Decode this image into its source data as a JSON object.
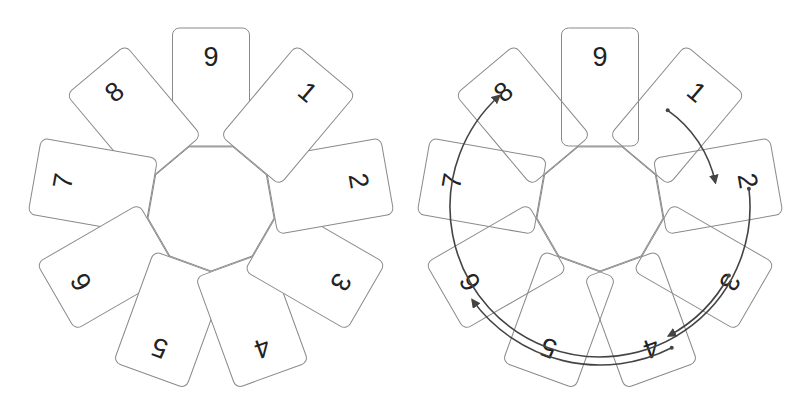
{
  "diagram": {
    "card_labels_clockwise_from_top": [
      "9",
      "1",
      "2",
      "3",
      "4",
      "5",
      "6",
      "7",
      "8"
    ],
    "colors": {
      "card_stroke": "#8a8a8a",
      "card_fill": "#ffffff",
      "label": "#222222",
      "arrow": "#444444"
    },
    "panels": [
      {
        "name": "left-ring",
        "center": [
          211,
          207
        ],
        "transparent_cards": false,
        "arrows": []
      },
      {
        "name": "right-ring",
        "center": [
          600,
          207
        ],
        "transparent_cards": true,
        "arrows": [
          {
            "from": "1",
            "to": "2",
            "radius": 118,
            "start_deg": 35,
            "end_deg": 78
          },
          {
            "from": "3",
            "to": "4",
            "radius": 146,
            "start_deg": 118,
            "end_deg": 152
          },
          {
            "from": "4",
            "to": "6",
            "radius": 158,
            "start_deg": 153,
            "end_deg": 234
          },
          {
            "from": "2",
            "to": "8",
            "radius": 150,
            "start_deg": 83,
            "end_deg": 318
          }
        ]
      }
    ],
    "cards": [
      {
        "label": "9",
        "angle": 0,
        "z": 0
      },
      {
        "label": "1",
        "angle": 40,
        "z": 9
      },
      {
        "label": "2",
        "angle": 80,
        "z": 8
      },
      {
        "label": "3",
        "angle": 120,
        "z": 7
      },
      {
        "label": "4",
        "angle": 160,
        "z": 6
      },
      {
        "label": "5",
        "angle": 200,
        "z": 5
      },
      {
        "label": "6",
        "angle": 240,
        "z": 4
      },
      {
        "label": "7",
        "angle": 280,
        "z": 3
      },
      {
        "label": "8",
        "angle": 320,
        "z": 2
      }
    ],
    "geometry": {
      "card_width": 77,
      "card_height": 118,
      "card_corner_radius": 7,
      "card_center_radius": 120,
      "label_offset_from_card_center": -30,
      "hub_radius": 64
    }
  }
}
